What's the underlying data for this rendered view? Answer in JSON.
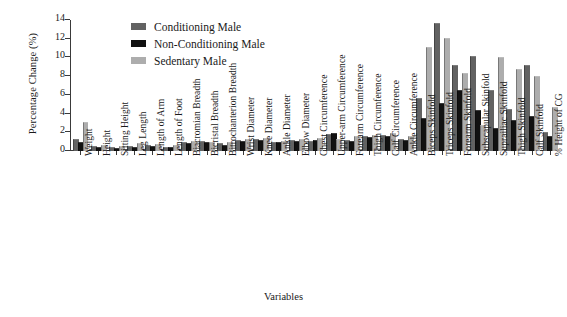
{
  "chart_data": {
    "type": "bar",
    "title": "",
    "xlabel": "Variables",
    "ylabel": "Percentage Change (%)",
    "ylim": [
      0,
      14
    ],
    "yticks": [
      0,
      2,
      4,
      6,
      8,
      10,
      12,
      14
    ],
    "grid": false,
    "legend_position": "top-center",
    "categories": [
      "Weight",
      "Height",
      "Sitting Height",
      "Leg Length",
      "Length of Arm",
      "Length of Foot",
      "Biacromian Breadth",
      "Bicristal Breadth",
      "Bitrochanterion Breadth",
      "Wrist Diameter",
      "Knee Diameter",
      "Ankle Diameter",
      "Elbow Diameter",
      "Chest Circumference",
      "Upper-arm Circumference",
      "Forearm Circumference",
      "Thigh Circumference",
      "Calf Circumference",
      "Ankle Circumference",
      "Biceps Skinfold",
      "Triceps Skinfold",
      "Forearm Skinfold",
      "Subscapular Skinfold",
      "Suprailiac Skinfold",
      "Thigh Skinfold",
      "Calf Skinfold",
      "% Height of CG"
    ],
    "series": [
      {
        "name": "Conditioning Male",
        "color": "#626262",
        "values": [
          1.2,
          0.4,
          0.3,
          0.4,
          0.5,
          0.3,
          0.9,
          1.0,
          0.8,
          1.1,
          1.2,
          0.9,
          1.1,
          1.0,
          1.7,
          1.1,
          1.5,
          1.6,
          1.2,
          5.6,
          13.6,
          9.1,
          10.0,
          6.4,
          4.4,
          9.1,
          1.9
        ]
      },
      {
        "name": "Non-Conditioning Male",
        "color": "#111111",
        "values": [
          0.9,
          0.3,
          0.2,
          0.3,
          0.4,
          0.3,
          0.8,
          0.9,
          0.5,
          1.0,
          1.1,
          0.9,
          1.0,
          1.1,
          1.8,
          1.0,
          1.4,
          1.5,
          1.1,
          3.4,
          5.0,
          6.4,
          4.3,
          2.4,
          3.2,
          3.6,
          1.5
        ]
      },
      {
        "name": "Sedentary Male",
        "color": "#adadad",
        "values": [
          3.0,
          0.5,
          0.4,
          0.7,
          0.6,
          0.5,
          1.0,
          0.9,
          0.9,
          1.2,
          1.3,
          1.0,
          1.2,
          1.3,
          1.2,
          1.5,
          1.6,
          1.8,
          1.5,
          11.0,
          12.0,
          8.2,
          2.7,
          9.9,
          8.7,
          7.9,
          4.6
        ]
      }
    ]
  }
}
